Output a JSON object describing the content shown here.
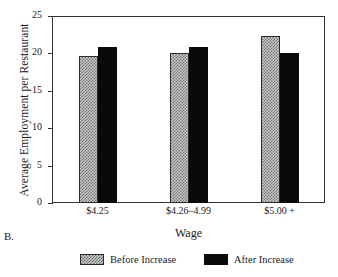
{
  "panel": {
    "label": "B."
  },
  "chart_data": {
    "type": "bar",
    "title": "",
    "xlabel": "Wage",
    "ylabel": "Average Employment per Restaurant",
    "categories": [
      "$4.25",
      "$4.26–4.99",
      "$5.00 +"
    ],
    "series": [
      {
        "name": "Before Increase",
        "values": [
          19.6,
          20.0,
          22.3
        ],
        "color": "#c9c9c9",
        "pattern": "checker-hatch"
      },
      {
        "name": "After Increase",
        "values": [
          20.8,
          20.9,
          20.1
        ],
        "color": "#0a0a0a",
        "pattern": "solid"
      }
    ],
    "ylim": [
      0,
      25
    ],
    "yticks": [
      0,
      5,
      10,
      15,
      20,
      25
    ],
    "ytick_labels": [
      "0",
      "5",
      "10",
      "15",
      "20",
      "25"
    ],
    "grid": false,
    "legend_position": "bottom"
  }
}
